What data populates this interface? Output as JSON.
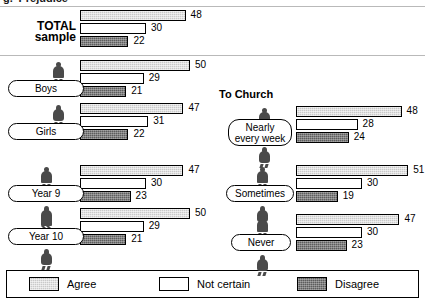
{
  "figure": {
    "cutoff_heading": "g. 'Prejudice'",
    "section_title_right": "To Church",
    "bar_start_left_px": 80,
    "bar_start_right_px": 296,
    "px_per_unit": 2.2
  },
  "legend": {
    "items": [
      {
        "label": "Agree",
        "key": "agree",
        "color": "#c9c9c9"
      },
      {
        "label": "Not certain",
        "key": "notcertain",
        "color": "#ffffff"
      },
      {
        "label": "Disagree",
        "key": "disagree",
        "color": "#5d5d5d"
      }
    ]
  },
  "chart_data": {
    "type": "bar",
    "title": "",
    "xlabel": "",
    "ylabel": "",
    "xlim": [
      0,
      55
    ],
    "grid": false,
    "legend_position": "bottom",
    "orientation": "horizontal",
    "series": [
      {
        "name": "Agree",
        "key": "agree"
      },
      {
        "name": "Not certain",
        "key": "notcertain"
      },
      {
        "name": "Disagree",
        "key": "disagree"
      }
    ],
    "panels": [
      {
        "panel_id": "left",
        "title": "",
        "groups": [
          {
            "id": "total-sample",
            "label": "TOTAL sample",
            "label_lines": [
              "TOTAL",
              "sample"
            ],
            "icons": [],
            "values": {
              "agree": 48,
              "notcertain": 30,
              "disagree": 22
            }
          },
          {
            "id": "boys",
            "label": "Boys",
            "label_lines": [
              "Boys"
            ],
            "icons": [
              "male"
            ],
            "values": {
              "agree": 50,
              "notcertain": 29,
              "disagree": 21
            }
          },
          {
            "id": "girls",
            "label": "Girls",
            "label_lines": [
              "Girls"
            ],
            "icons": [
              "female"
            ],
            "values": {
              "agree": 47,
              "notcertain": 31,
              "disagree": 22
            }
          },
          {
            "id": "year-9",
            "label": "Year 9",
            "label_lines": [
              "Year 9"
            ],
            "icons": [
              "male",
              "female"
            ],
            "values": {
              "agree": 47,
              "notcertain": 30,
              "disagree": 23
            }
          },
          {
            "id": "year-10",
            "label": "Year 10",
            "label_lines": [
              "Year 10"
            ],
            "icons": [
              "male",
              "female"
            ],
            "values": {
              "agree": 50,
              "notcertain": 29,
              "disagree": 21
            }
          }
        ]
      },
      {
        "panel_id": "right",
        "title": "To Church",
        "groups": [
          {
            "id": "nearly-every-week",
            "label": "Nearly every week",
            "label_lines": [
              "Nearly",
              "every week"
            ],
            "icons": [
              "male",
              "female"
            ],
            "values": {
              "agree": 48,
              "notcertain": 28,
              "disagree": 24
            }
          },
          {
            "id": "sometimes",
            "label": "Sometimes",
            "label_lines": [
              "Sometimes"
            ],
            "icons": [
              "male",
              "female"
            ],
            "values": {
              "agree": 51,
              "notcertain": 30,
              "disagree": 19
            }
          },
          {
            "id": "never",
            "label": "Never",
            "label_lines": [
              "Never"
            ],
            "icons": [
              "male",
              "female"
            ],
            "values": {
              "agree": 47,
              "notcertain": 30,
              "disagree": 23
            }
          }
        ]
      }
    ]
  }
}
